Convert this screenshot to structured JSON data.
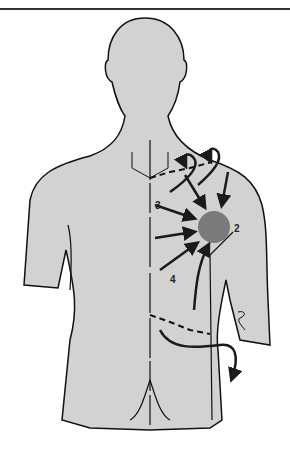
{
  "figure": {
    "labels": [
      {
        "id": "2",
        "text": "2"
      },
      {
        "id": "3",
        "text": "3"
      },
      {
        "id": "4",
        "text": "4"
      }
    ],
    "colors": {
      "body_fill": "#d2d2d2",
      "outline": "#111111",
      "focus_circle": "#7a7a7a",
      "arrows": "#1a1a1a",
      "background": "#ffffff"
    }
  }
}
